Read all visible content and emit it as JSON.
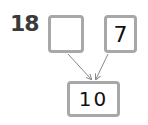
{
  "problem_number": "18",
  "boxes": {
    "left_part": "",
    "right_part": "7",
    "whole": "10"
  },
  "colors": {
    "box_border": "#a8a8a8",
    "arrow": "#888888"
  }
}
